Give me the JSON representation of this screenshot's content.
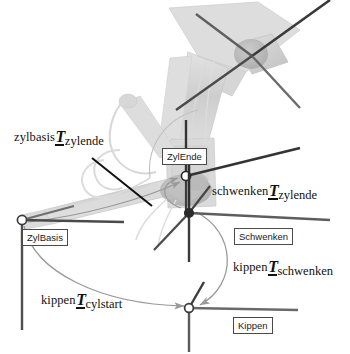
{
  "figure": {
    "type": "technical-diagram",
    "background_color": "#ffffff",
    "width": 350,
    "height": 354
  },
  "colors": {
    "frame_box_border": "#4a4a4a",
    "frame_box_fill": "#ffffff",
    "label_text": "#1b1b1b",
    "axis_dark": "#2b2b2b",
    "axis_mid": "#6e6e6e",
    "transform_arc": "#9a9a9a",
    "leader_line": "#111111",
    "machine_body": "#b9b9b9",
    "machine_body_dark": "#8d8d8d"
  },
  "frames": [
    {
      "id": "zylende",
      "label": "ZylEnde",
      "box_x": 162,
      "box_y": 148,
      "origin_x": 186,
      "origin_y": 176
    },
    {
      "id": "zylbasis",
      "label": "ZylBasis",
      "box_x": 22,
      "box_y": 229,
      "origin_x": 22,
      "origin_y": 220
    },
    {
      "id": "schwenken",
      "label": "Schwenken",
      "box_x": 234,
      "box_y": 228,
      "origin_x": 189,
      "origin_y": 213
    },
    {
      "id": "kippen",
      "label": "Kippen",
      "box_x": 233,
      "box_y": 317,
      "origin_x": 189,
      "origin_y": 308
    }
  ],
  "transforms": [
    {
      "id": "zylbasis-to-zylende",
      "source": "zylbasis",
      "symbol": "T",
      "target": "zylende",
      "x": 14,
      "y": 128,
      "has_leader_line": true
    },
    {
      "id": "schwenken-to-zylende",
      "source": "schwenken",
      "symbol": "T",
      "target": "zylende",
      "x": 212,
      "y": 182,
      "has_leader_line": false
    },
    {
      "id": "kippen-to-schwenken",
      "source": "kippen",
      "symbol": "T",
      "target": "schwenken",
      "x": 233,
      "y": 258,
      "has_leader_line": false
    },
    {
      "id": "kippen-to-cylstart",
      "source": "kippen",
      "symbol": "T",
      "target": "cylstart",
      "x": 41,
      "y": 291,
      "has_leader_line": false
    }
  ]
}
